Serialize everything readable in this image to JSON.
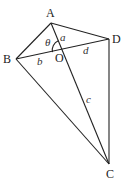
{
  "diagram": {
    "type": "quadrilateral-with-diagonals",
    "points": {
      "A": {
        "label": "A",
        "x": 51,
        "y": 23
      },
      "B": {
        "label": "B",
        "x": 16,
        "y": 59
      },
      "C": {
        "label": "C",
        "x": 109,
        "y": 164
      },
      "D": {
        "label": "D",
        "x": 109,
        "y": 39
      },
      "O": {
        "label": "O",
        "x": 62,
        "y": 50
      }
    },
    "segment_labels": {
      "a": "a",
      "b": "b",
      "c": "c",
      "d": "d"
    },
    "angle_label": "θ",
    "edges": [
      "AB",
      "AD",
      "BC",
      "DC",
      "AC",
      "BD"
    ]
  }
}
